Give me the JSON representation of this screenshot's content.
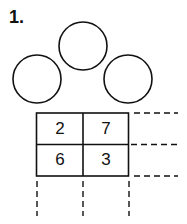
{
  "problem": {
    "number_label": "1.",
    "circles": [
      {
        "position": "top",
        "value": ""
      },
      {
        "position": "left",
        "value": ""
      },
      {
        "position": "right",
        "value": ""
      }
    ],
    "grid": {
      "rows": [
        [
          "2",
          "7"
        ],
        [
          "6",
          "3"
        ]
      ],
      "row_extensions": "dashed",
      "column_extensions": "dashed"
    }
  }
}
